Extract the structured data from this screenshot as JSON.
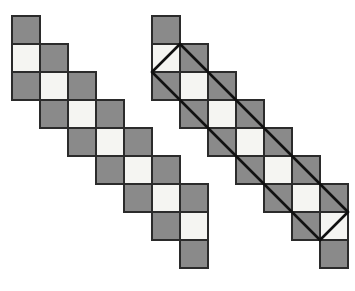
{
  "figure": {
    "canvas": {
      "width": 355,
      "height": 291,
      "background": "#ffffff"
    }
  },
  "style": {
    "gray_fill": "#8a8a8a",
    "light_fill": "#f5f5f2",
    "cell_stroke": "#2b2b2b",
    "cell_stroke_width": 1.2,
    "diagonal_stroke": "#111111",
    "diagonal_stroke_width": 2.6,
    "cell_size": 28
  },
  "shapes": [
    {
      "name": "left-staircase",
      "label": "Left staircase strip",
      "origin_x": 12,
      "origin_y": 16,
      "cell": 28,
      "rows": 9,
      "has_diagonals": false,
      "cells": [
        {
          "col": 0,
          "row": 0,
          "fill": "gray"
        },
        {
          "col": 0,
          "row": 1,
          "fill": "light"
        },
        {
          "col": 1,
          "row": 1,
          "fill": "gray"
        },
        {
          "col": 0,
          "row": 2,
          "fill": "gray"
        },
        {
          "col": 1,
          "row": 2,
          "fill": "light"
        },
        {
          "col": 2,
          "row": 2,
          "fill": "gray"
        },
        {
          "col": 1,
          "row": 3,
          "fill": "gray"
        },
        {
          "col": 2,
          "row": 3,
          "fill": "light"
        },
        {
          "col": 3,
          "row": 3,
          "fill": "gray"
        },
        {
          "col": 2,
          "row": 4,
          "fill": "gray"
        },
        {
          "col": 3,
          "row": 4,
          "fill": "light"
        },
        {
          "col": 4,
          "row": 4,
          "fill": "gray"
        },
        {
          "col": 3,
          "row": 5,
          "fill": "gray"
        },
        {
          "col": 4,
          "row": 5,
          "fill": "light"
        },
        {
          "col": 5,
          "row": 5,
          "fill": "gray"
        },
        {
          "col": 4,
          "row": 6,
          "fill": "gray"
        },
        {
          "col": 5,
          "row": 6,
          "fill": "light"
        },
        {
          "col": 6,
          "row": 6,
          "fill": "gray"
        },
        {
          "col": 5,
          "row": 7,
          "fill": "gray"
        },
        {
          "col": 6,
          "row": 7,
          "fill": "light"
        },
        {
          "col": 6,
          "row": 8,
          "fill": "gray"
        }
      ],
      "diagonals": []
    },
    {
      "name": "right-staircase",
      "label": "Right staircase strip with diagonal band",
      "origin_x": 152,
      "origin_y": 16,
      "cell": 28,
      "rows": 9,
      "has_diagonals": true,
      "cells": [
        {
          "col": 0,
          "row": 0,
          "fill": "gray"
        },
        {
          "col": 0,
          "row": 1,
          "fill": "light"
        },
        {
          "col": 1,
          "row": 1,
          "fill": "gray"
        },
        {
          "col": 0,
          "row": 2,
          "fill": "gray"
        },
        {
          "col": 1,
          "row": 2,
          "fill": "light"
        },
        {
          "col": 2,
          "row": 2,
          "fill": "gray"
        },
        {
          "col": 1,
          "row": 3,
          "fill": "gray"
        },
        {
          "col": 2,
          "row": 3,
          "fill": "light"
        },
        {
          "col": 3,
          "row": 3,
          "fill": "gray"
        },
        {
          "col": 2,
          "row": 4,
          "fill": "gray"
        },
        {
          "col": 3,
          "row": 4,
          "fill": "light"
        },
        {
          "col": 4,
          "row": 4,
          "fill": "gray"
        },
        {
          "col": 3,
          "row": 5,
          "fill": "gray"
        },
        {
          "col": 4,
          "row": 5,
          "fill": "light"
        },
        {
          "col": 5,
          "row": 5,
          "fill": "gray"
        },
        {
          "col": 4,
          "row": 6,
          "fill": "gray"
        },
        {
          "col": 5,
          "row": 6,
          "fill": "light"
        },
        {
          "col": 6,
          "row": 6,
          "fill": "gray"
        },
        {
          "col": 5,
          "row": 7,
          "fill": "gray"
        },
        {
          "col": 6,
          "row": 7,
          "fill": "light"
        },
        {
          "col": 6,
          "row": 8,
          "fill": "gray"
        }
      ],
      "diagonals": {
        "label": "parallelogram band",
        "top_apex": {
          "col": 1,
          "row": 1
        },
        "left_apex": {
          "col": 0,
          "row": 2
        },
        "right_apex": {
          "col": 7,
          "row": 7
        },
        "bottom_apex": {
          "col": 6,
          "row": 8
        },
        "lines": [
          {
            "name": "upper-diagonal",
            "from": {
              "col": 1,
              "row": 1
            },
            "to": {
              "col": 7,
              "row": 7
            }
          },
          {
            "name": "lower-diagonal",
            "from": {
              "col": 0,
              "row": 2
            },
            "to": {
              "col": 6,
              "row": 8
            }
          },
          {
            "name": "top-left-cap",
            "from": {
              "col": 0,
              "row": 2
            },
            "to": {
              "col": 1,
              "row": 1
            }
          },
          {
            "name": "bottom-right-cap",
            "from": {
              "col": 6,
              "row": 8
            },
            "to": {
              "col": 7,
              "row": 7
            }
          }
        ]
      }
    }
  ]
}
